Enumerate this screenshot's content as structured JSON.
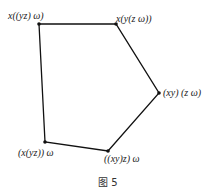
{
  "figure": {
    "caption": "图 5",
    "edge_color": "#111111",
    "vertices": [
      {
        "id": "v1",
        "label": "x((yz) ω)",
        "x": 39,
        "y": 24
      },
      {
        "id": "v2",
        "label": "x(y(z ω))",
        "x": 116,
        "y": 24
      },
      {
        "id": "v3",
        "label": "(xy) (z ω)",
        "x": 159,
        "y": 93
      },
      {
        "id": "v4",
        "label": "((xy)z) ω",
        "x": 108,
        "y": 151
      },
      {
        "id": "v5",
        "label": "(x(yz)) ω",
        "x": 45,
        "y": 142
      }
    ],
    "edges": [
      [
        "v1",
        "v2"
      ],
      [
        "v2",
        "v3"
      ],
      [
        "v3",
        "v4"
      ],
      [
        "v4",
        "v5"
      ],
      [
        "v5",
        "v1"
      ]
    ]
  }
}
